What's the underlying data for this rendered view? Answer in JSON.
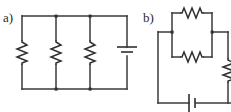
{
  "figure": {
    "background_color": "#ffffff",
    "wire_color": "#3a3a3a",
    "symbol_color": "#2e2e2e",
    "width": 231,
    "height": 112
  },
  "panels": [
    {
      "id": "a",
      "label": "a)",
      "description": "Three resistors in parallel connected across a battery",
      "components": [
        {
          "type": "resistor",
          "orientation": "vertical",
          "name": "resistor-a1"
        },
        {
          "type": "resistor",
          "orientation": "vertical",
          "name": "resistor-a2"
        },
        {
          "type": "resistor",
          "orientation": "vertical",
          "name": "resistor-a3"
        },
        {
          "type": "battery",
          "orientation": "vertical",
          "name": "battery-a"
        }
      ],
      "junction_count": 4
    },
    {
      "id": "b",
      "label": "b)",
      "description": "Two resistors in parallel, in series with a third resistor and a battery",
      "components": [
        {
          "type": "resistor",
          "orientation": "horizontal",
          "name": "resistor-b1"
        },
        {
          "type": "resistor",
          "orientation": "horizontal",
          "name": "resistor-b2"
        },
        {
          "type": "resistor",
          "orientation": "vertical",
          "name": "resistor-b3"
        },
        {
          "type": "battery",
          "orientation": "horizontal",
          "name": "battery-b"
        }
      ],
      "junction_count": 2
    }
  ]
}
